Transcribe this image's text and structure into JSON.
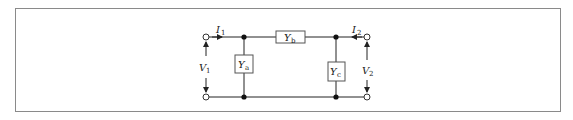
{
  "diagram": {
    "type": "two-port pi-network",
    "currents": {
      "left": {
        "symbol": "I",
        "sub": "1"
      },
      "right": {
        "symbol": "I",
        "sub": "2"
      }
    },
    "voltages": {
      "left": {
        "symbol": "V",
        "sub": "1"
      },
      "right": {
        "symbol": "V",
        "sub": "2"
      }
    },
    "admittances": {
      "shunt_left": {
        "symbol": "Y",
        "sub": "a"
      },
      "series": {
        "symbol": "Y",
        "sub": "b"
      },
      "shunt_right": {
        "symbol": "Y",
        "sub": "c"
      }
    },
    "colors": {
      "line": "#222222",
      "frame": "#8a8a8a",
      "box": "#555555"
    }
  }
}
